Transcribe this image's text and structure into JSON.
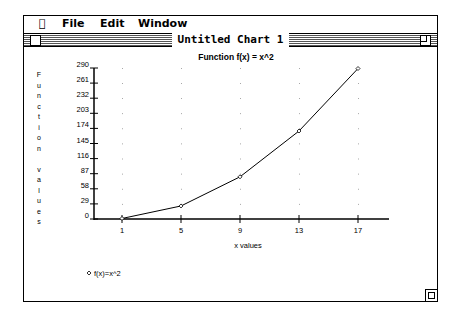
{
  "menubar": {
    "apple_icon": "",
    "items": [
      {
        "label": "File"
      },
      {
        "label": "Edit"
      },
      {
        "label": "Window"
      }
    ]
  },
  "window": {
    "title": "Untitled Chart  1"
  },
  "chart_data": {
    "type": "line",
    "title": "Function f(x) = x^2",
    "xlabel": "x values",
    "ylabel": "Function values",
    "ylabel_chars": [
      "F",
      "u",
      "n",
      "c",
      "t",
      "i",
      "o",
      "n",
      "",
      "v",
      "a",
      "l",
      "u",
      "e",
      "s"
    ],
    "x": [
      1,
      5,
      9,
      13,
      17
    ],
    "categories": [
      "1",
      "5",
      "9",
      "13",
      "17"
    ],
    "y_ticks": [
      "0",
      "29",
      "58",
      "87",
      "116",
      "145",
      "174",
      "203",
      "232",
      "261",
      "290"
    ],
    "ylim": [
      0,
      290
    ],
    "grid": "dotted",
    "legend_position": "bottom-left",
    "series": [
      {
        "name": "f(x)=x^2",
        "values": [
          1,
          25,
          81,
          169,
          289
        ],
        "marker": "diamond",
        "color": "#000000"
      }
    ]
  },
  "legend": {
    "label": "f(x)=x^2"
  }
}
